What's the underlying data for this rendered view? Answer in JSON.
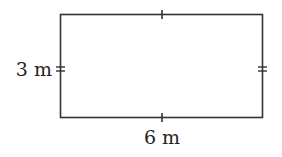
{
  "diagram": {
    "shape": "rectangle",
    "width_label": "6 m",
    "height_label": "3 m",
    "stroke_color": "#333333",
    "tick_marks": {
      "horizontal_sides": "single",
      "vertical_sides": "double"
    }
  }
}
